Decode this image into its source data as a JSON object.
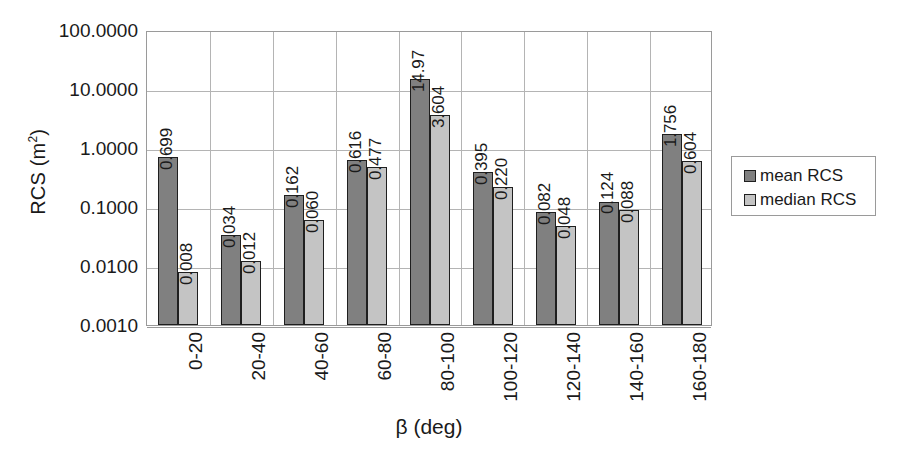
{
  "chart_data": {
    "type": "bar",
    "title": "",
    "xlabel": "β (deg)",
    "ylabel": "RCS (m²)",
    "ylabel_base": "RCS (m",
    "ylabel_sup": "2",
    "ylabel_close": ")",
    "yscale": "log",
    "ylim": [
      0.001,
      100
    ],
    "ytick_labels": [
      "100.0000",
      "10.0000",
      "1.0000",
      "0.1000",
      "0.0100",
      "0.0010"
    ],
    "ytick_values": [
      100,
      10,
      1,
      0.1,
      0.01,
      0.001
    ],
    "grid": "horizontal-and-vertical",
    "legend_position": "right",
    "categories": [
      "0-20",
      "20-40",
      "40-60",
      "60-80",
      "80-100",
      "100-120",
      "120-140",
      "140-160",
      "160-180"
    ],
    "series": [
      {
        "name": "mean RCS",
        "color": "#808080",
        "values": [
          0.699,
          0.034,
          0.162,
          0.616,
          14.97,
          0.395,
          0.082,
          0.124,
          1.756
        ],
        "labels": [
          "0.699",
          "0.034",
          "0.162",
          "0.616",
          "14.97",
          "0.395",
          "0.082",
          "0.124",
          "1.756"
        ]
      },
      {
        "name": "median RCS",
        "color": "#c4c4c4",
        "values": [
          0.008,
          0.012,
          0.06,
          0.477,
          3.604,
          0.22,
          0.048,
          0.088,
          0.604
        ],
        "labels": [
          "0.008",
          "0.012",
          "0.060",
          "0.477",
          "3.604",
          "0.220",
          "0.048",
          "0.088",
          "0.604"
        ]
      }
    ]
  },
  "legend": {
    "items": [
      {
        "label": "mean RCS",
        "color": "#808080"
      },
      {
        "label": "median RCS",
        "color": "#c4c4c4"
      }
    ]
  }
}
